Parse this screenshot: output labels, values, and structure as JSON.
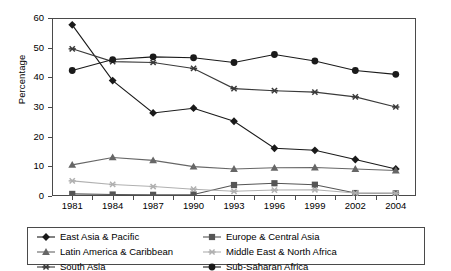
{
  "chart_data": {
    "type": "line",
    "title": "",
    "subtitle": "",
    "xlabel": "",
    "ylabel": "Percentage",
    "categories": [
      "1981",
      "1984",
      "1987",
      "1990",
      "1993",
      "1996",
      "1999",
      "2002",
      "2004"
    ],
    "ylim": [
      0,
      60
    ],
    "ytick_labels": [
      "0",
      "10",
      "20",
      "30",
      "40",
      "50",
      "60"
    ],
    "ytick_values": [
      0,
      10,
      20,
      30,
      40,
      50,
      60
    ],
    "grid": false,
    "legend_position": "bottom",
    "series": [
      {
        "name": "East Asia & Pacific",
        "marker": "diamond",
        "color": "#1a1a1a",
        "values": [
          57.7,
          38.9,
          28.0,
          29.6,
          25.2,
          16.1,
          15.4,
          12.3,
          9.1
        ]
      },
      {
        "name": "Europe & Central Asia",
        "marker": "square",
        "color": "#555555",
        "values": [
          0.7,
          0.5,
          0.4,
          0.5,
          3.7,
          4.3,
          3.8,
          1.0,
          0.9
        ]
      },
      {
        "name": "Latin America & Caribbean",
        "marker": "triangle",
        "color": "#666666",
        "values": [
          10.5,
          13.0,
          12.0,
          9.9,
          9.1,
          9.5,
          9.6,
          9.1,
          8.6
        ]
      },
      {
        "name": "Middle East & North Africa",
        "marker": "star",
        "color": "#b0b0b0",
        "values": [
          5.1,
          3.9,
          3.2,
          2.3,
          1.6,
          2.0,
          2.1,
          1.0,
          0.9
        ]
      },
      {
        "name": "South Asia",
        "marker": "asterisk",
        "color": "#3a3a3a",
        "values": [
          49.6,
          45.3,
          45.0,
          43.0,
          36.2,
          35.5,
          35.0,
          33.4,
          30.0
        ]
      },
      {
        "name": "Sub-Saharan Africa",
        "marker": "circle",
        "color": "#1a1a1a",
        "values": [
          42.3,
          46.0,
          46.9,
          46.6,
          45.0,
          47.7,
          45.5,
          42.3,
          41.0
        ]
      }
    ]
  },
  "axis": {
    "y_title": "Percentage"
  }
}
